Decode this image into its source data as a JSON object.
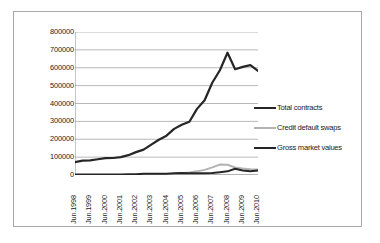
{
  "chart_data": {
    "type": "line",
    "title": "",
    "subtitle": "",
    "xlabel": "",
    "ylabel": "",
    "grid": true,
    "legend_position": "right",
    "ylim": [
      0,
      800000
    ],
    "ytick_values": [
      800000,
      700000,
      600000,
      500000,
      400000,
      300000,
      200000,
      100000,
      0
    ],
    "ytick_labels": [
      "800000",
      "700000",
      "600000",
      "500000",
      "400000",
      "300000",
      "200000",
      "100000",
      "0"
    ],
    "categories": [
      "Jun.1998",
      "Dec.1998",
      "Jun.1999",
      "Dec.1999",
      "Jun.2000",
      "Dec.2000",
      "Jun.2001",
      "Dec.2001",
      "Jun.2002",
      "Dec.2002",
      "Jun.2003",
      "Dec.2003",
      "Jun.2004",
      "Dec.2004",
      "Jun.2005",
      "Dec.2005",
      "Jun.2006",
      "Dec.2006",
      "Jun.2007",
      "Dec.2007",
      "Jun.2008",
      "Dec.2008",
      "Jun.2009",
      "Dec.2009",
      "Jun.2010"
    ],
    "xtick_labels": [
      "Jun.1998",
      "Jun.1999",
      "Jun.2000",
      "Jun.2001",
      "Jun.2002",
      "Jun.2003",
      "Jun.2004",
      "Jun.2005",
      "Jun.2006",
      "Jun.2007",
      "Jun.2008",
      "Jun.2009",
      "Jun.2010"
    ],
    "series": [
      {
        "name": "Total contracts",
        "color": "#262626",
        "width": 2.2,
        "values": [
          72000,
          80000,
          82000,
          88000,
          94000,
          95000,
          100000,
          111000,
          128000,
          142000,
          170000,
          197000,
          220000,
          258000,
          281000,
          298000,
          370000,
          418000,
          516000,
          586000,
          684000,
          592000,
          605000,
          615000,
          583000
        ]
      },
      {
        "name": "Credit default swaps",
        "color": "#b3b3b3",
        "width": 2.0,
        "values": [
          0,
          0,
          0,
          0,
          0,
          0,
          0,
          0,
          0,
          2192,
          2688,
          3779,
          5442,
          6396,
          10211,
          13908,
          20352,
          28650,
          42580,
          58244,
          57325,
          41868,
          36046,
          32693,
          30261
        ]
      },
      {
        "name": "Gross market values",
        "color": "#262626",
        "width": 2.0,
        "values": [
          2580,
          3230,
          2628,
          3230,
          2581,
          3183,
          3045,
          3788,
          4450,
          6360,
          6987,
          6987,
          6395,
          9377,
          10605,
          9749,
          9936,
          9691,
          11140,
          15813,
          20353,
          35281,
          25298,
          21542,
          24673
        ]
      }
    ]
  },
  "legend": {
    "items": [
      {
        "label": "Total contracts",
        "color": "#262626",
        "thickness": "2.4px"
      },
      {
        "label": "Credit default swaps",
        "color": "#b3b3b3",
        "thickness": "2.0px"
      },
      {
        "label": "Gross market values",
        "color": "#262626",
        "thickness": "2.2px"
      }
    ]
  },
  "style": {
    "grid_color": "#999999",
    "axis_color": "#808080",
    "frame_color": "#a8a8a8",
    "background": "#ffffff",
    "text_color": "#1a1a1a"
  }
}
